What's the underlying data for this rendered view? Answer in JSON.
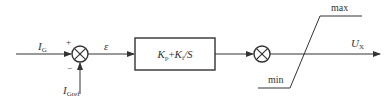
{
  "diagram": {
    "type": "control-block-diagram",
    "line_color": "#333333",
    "input": {
      "label": "I",
      "subscript": "G"
    },
    "reference": {
      "label": "I",
      "subscript": "Gref"
    },
    "sum1": {
      "plus": "+",
      "minus": "−"
    },
    "error": {
      "label": "ε"
    },
    "controller": {
      "label_kp": "K",
      "kp_sub": "p",
      "plus": "+",
      "label_ki": "K",
      "ki_sub": "i",
      "div": "/S"
    },
    "output": {
      "label": "U",
      "subscript": "X"
    },
    "limiter": {
      "max_label": "max",
      "min_label": "min"
    }
  }
}
